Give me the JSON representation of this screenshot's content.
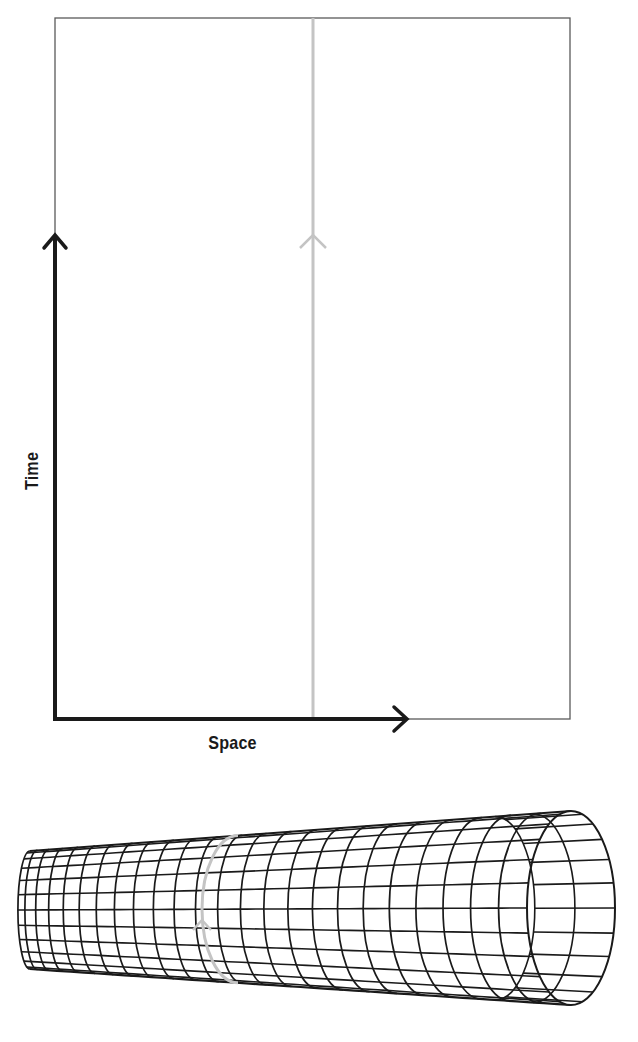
{
  "figure": {
    "type": "spacetime-diagram",
    "colors": {
      "background": "#ffffff",
      "frame": "#5a5a5a",
      "axis": "#1a1a1a",
      "worldline": "#c4c4c4",
      "mesh": "#1a1a1a"
    }
  },
  "spacetime_diagram": {
    "frame": {
      "x": 55,
      "y": 18,
      "width": 515,
      "height": 701
    },
    "time_axis": {
      "label": "Time",
      "x": 55,
      "y_start": 719,
      "y_end": 235,
      "arrow": "arrow-up-icon"
    },
    "space_axis": {
      "label": "Space",
      "y": 719,
      "x_start": 55,
      "x_end": 407,
      "arrow": "arrow-right-icon"
    },
    "worldline": {
      "x": 313,
      "y_start": 18,
      "y_end": 719,
      "arrow_y": 235,
      "arrow": "arrow-up-icon"
    }
  },
  "cylinder_diagram": {
    "type": "rolled-up-spacetime-tube",
    "left_end": {
      "cx": 30,
      "cy": 910,
      "ry": 59,
      "rx": 22
    },
    "right_end": {
      "cx": 571,
      "cy": 908,
      "ry": 97,
      "rx": 44
    },
    "ring_count": 24,
    "generator_count": 12,
    "worldline_ring": {
      "x_top": 238,
      "x_mid": 202,
      "arrow_y": 920,
      "arrow": "arrow-up-icon"
    }
  }
}
